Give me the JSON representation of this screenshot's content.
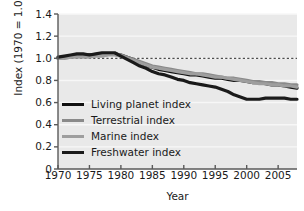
{
  "chart_data": {
    "type": "line",
    "title": "",
    "xlabel": "Year",
    "ylabel": "Index (1970 = 1.0)",
    "xlim": [
      1970,
      2008
    ],
    "ylim": [
      0,
      1.4
    ],
    "xticks": [
      1970,
      1975,
      1980,
      1985,
      1990,
      1995,
      2000,
      2005
    ],
    "yticks": [
      "0",
      "0.2",
      "0.4",
      "0.6",
      "0.8",
      "1.0",
      "1.2",
      "1.4"
    ],
    "grid": true,
    "legend_position": "lower-left-inside",
    "reference_line": {
      "y": 1.0,
      "style": "dashed",
      "color": "#4d4d4d"
    },
    "plot_background": "#e9e9e9",
    "x": [
      1970,
      1971,
      1972,
      1973,
      1974,
      1975,
      1976,
      1977,
      1978,
      1979,
      1980,
      1981,
      1982,
      1983,
      1984,
      1985,
      1986,
      1987,
      1988,
      1989,
      1990,
      1991,
      1992,
      1993,
      1994,
      1995,
      1996,
      1997,
      1998,
      1999,
      2000,
      2001,
      2002,
      2003,
      2004,
      2005,
      2006,
      2007,
      2008
    ],
    "series": [
      {
        "name": "Living planet index",
        "color": "#111111",
        "width": 3.2,
        "values": [
          1.0,
          1.01,
          1.02,
          1.03,
          1.03,
          1.03,
          1.03,
          1.04,
          1.04,
          1.04,
          1.03,
          1.01,
          0.99,
          0.96,
          0.94,
          0.92,
          0.9,
          0.89,
          0.88,
          0.87,
          0.86,
          0.85,
          0.85,
          0.84,
          0.83,
          0.82,
          0.82,
          0.81,
          0.8,
          0.8,
          0.79,
          0.78,
          0.78,
          0.77,
          0.76,
          0.76,
          0.75,
          0.74,
          0.73
        ]
      },
      {
        "name": "Terrestrial index",
        "color": "#8a8a8a",
        "width": 3.2,
        "values": [
          1.0,
          1.0,
          1.01,
          1.02,
          1.02,
          1.02,
          1.03,
          1.03,
          1.04,
          1.04,
          1.03,
          1.01,
          0.99,
          0.97,
          0.95,
          0.93,
          0.92,
          0.91,
          0.9,
          0.89,
          0.88,
          0.87,
          0.86,
          0.86,
          0.85,
          0.84,
          0.83,
          0.82,
          0.82,
          0.81,
          0.8,
          0.79,
          0.79,
          0.78,
          0.78,
          0.77,
          0.77,
          0.76,
          0.76
        ]
      },
      {
        "name": "Marine index",
        "color": "#9e9e9e",
        "width": 3.2,
        "values": [
          1.0,
          1.0,
          1.01,
          1.01,
          1.01,
          1.01,
          1.02,
          1.02,
          1.03,
          1.03,
          1.02,
          1.0,
          0.98,
          0.96,
          0.94,
          0.92,
          0.91,
          0.9,
          0.89,
          0.88,
          0.87,
          0.86,
          0.86,
          0.85,
          0.84,
          0.83,
          0.83,
          0.82,
          0.81,
          0.8,
          0.79,
          0.78,
          0.77,
          0.77,
          0.76,
          0.76,
          0.75,
          0.75,
          0.74
        ]
      },
      {
        "name": "Freshwater index",
        "color": "#1a1a1a",
        "width": 3.2,
        "values": [
          1.01,
          1.02,
          1.03,
          1.04,
          1.04,
          1.03,
          1.04,
          1.05,
          1.05,
          1.05,
          1.02,
          0.99,
          0.96,
          0.93,
          0.91,
          0.88,
          0.86,
          0.85,
          0.83,
          0.81,
          0.8,
          0.78,
          0.77,
          0.76,
          0.75,
          0.74,
          0.72,
          0.7,
          0.67,
          0.65,
          0.63,
          0.63,
          0.63,
          0.64,
          0.64,
          0.64,
          0.64,
          0.63,
          0.63
        ]
      }
    ]
  },
  "axis": {
    "ylabel": "Index (1970 = 1.0)",
    "xlabel": "Year",
    "yticks": [
      "1.4",
      "1.2",
      "1.0",
      "0.8",
      "0.6",
      "0.4",
      "0.2",
      "0"
    ],
    "xticks": [
      "1970",
      "1975",
      "1980",
      "1985",
      "1990",
      "1995",
      "2000",
      "2005"
    ]
  },
  "legend": {
    "items": [
      {
        "label": "Living planet index",
        "color": "#111111"
      },
      {
        "label": "Terrestrial index",
        "color": "#8a8a8a"
      },
      {
        "label": "Marine index",
        "color": "#9e9e9e"
      },
      {
        "label": "Freshwater index",
        "color": "#1a1a1a"
      }
    ]
  }
}
